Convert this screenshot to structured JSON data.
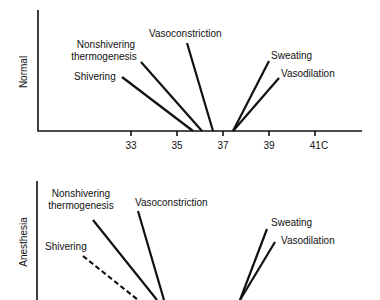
{
  "panels": {
    "normal": {
      "ylabel": "Normal",
      "xaxis_unit": "C",
      "ticks": [
        "33",
        "35",
        "37",
        "39",
        "41C"
      ],
      "responses": {
        "vasoconstriction": "Vasoconstriction",
        "nonshivering_1": "Nonshivering",
        "nonshivering_2": "thermogenesis",
        "shivering": "Shivering",
        "sweating": "Sweating",
        "vasodilation": "Vasodilation"
      }
    },
    "anesthesia": {
      "ylabel": "Anesthesia",
      "responses": {
        "vasoconstriction": "Vasoconstriction",
        "nonshivering_1": "Nonshivering",
        "nonshivering_2": "thermogenesis",
        "shivering": "Shivering",
        "sweating": "Sweating",
        "vasodilation": "Vasodilation"
      }
    }
  },
  "colors": {
    "line": "#111111",
    "background": "#ffffff"
  }
}
